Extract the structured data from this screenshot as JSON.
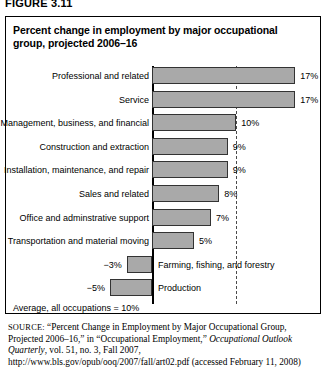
{
  "figure_label": "FIGURE 3.11",
  "chart_data": {
    "type": "bar",
    "orientation": "horizontal",
    "title": "Percent change in employment by major occupational group, projected 2006–16",
    "xlabel": "",
    "ylabel": "",
    "grid": false,
    "legend": "none",
    "xlim": [
      -6,
      18
    ],
    "categories": [
      "Professional and related",
      "Service",
      "Management, business, and financial",
      "Construction and extraction",
      "Installation, maintenance, and repair",
      "Sales and related",
      "Office and adminstrative support",
      "Transportation and material moving",
      "Farming, fishing, and forestry",
      "Production"
    ],
    "values": [
      17,
      17,
      10,
      9,
      9,
      8,
      7,
      5,
      -3,
      -5
    ],
    "value_labels": [
      "17%",
      "17%",
      "10%",
      "9%",
      "9%",
      "8%",
      "7%",
      "5%",
      "−3%",
      "−5%"
    ],
    "reference_line": {
      "value": 10,
      "label": "Average, all occupations = 10%",
      "style": "dashed"
    },
    "bar_color": "#a9a9a9",
    "bar_border_color": "#333333"
  },
  "avg_note": "Average, all occupations = 10%",
  "source": {
    "prefix": "SOURCE:",
    "part1": " “Percent Change in Employment by Major Occupational Group, Projected 2006–16,” in “Occupational Employment,” ",
    "italic": "Occupational Outlook Quarterly",
    "part2": ", vol. 51, no. 3, Fall 2007, http://www.bls.gov/opub/ooq/2007/fall/art02.pdf (accessed February 11, 2008)"
  }
}
